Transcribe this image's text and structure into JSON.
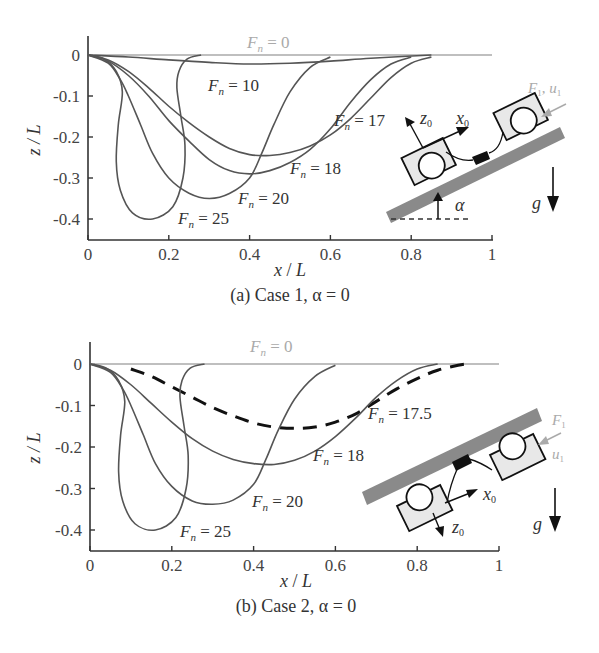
{
  "chart_data": [
    {
      "type": "line",
      "title": "(a) Case 1, α = 0",
      "caption": "(a) Case 1, α = 0",
      "xlabel": "x / L",
      "ylabel": "z / L",
      "xlim": [
        0,
        1
      ],
      "ylim": [
        -0.45,
        0.05
      ],
      "xticks": [
        "0",
        "0.2",
        "0.4",
        "0.6",
        "0.8",
        "1"
      ],
      "yticks": [
        "0",
        "-0.1",
        "-0.2",
        "-0.3",
        "-0.4"
      ],
      "grid": false,
      "series": [
        {
          "name": "Fn = 0",
          "label": "Fn = 0",
          "color": "#aaaaaa",
          "dashed": false,
          "x": [
            0,
            0.2,
            0.4,
            0.6,
            0.8,
            1.0
          ],
          "y": [
            0,
            0,
            0,
            0,
            0,
            0
          ]
        },
        {
          "name": "Fn = 10",
          "label": "Fn = 10",
          "color": "#555555",
          "dashed": false,
          "x": [
            0,
            0.1,
            0.2,
            0.3,
            0.4,
            0.5,
            0.6,
            0.7,
            0.85
          ],
          "y": [
            0,
            -0.005,
            -0.012,
            -0.018,
            -0.022,
            -0.02,
            -0.015,
            -0.008,
            0
          ]
        },
        {
          "name": "Fn = 17",
          "label": "Fn = 17",
          "color": "#555555",
          "dashed": false,
          "x": [
            0,
            0.05,
            0.1,
            0.15,
            0.2,
            0.25,
            0.3,
            0.35,
            0.4,
            0.45,
            0.5,
            0.55,
            0.6,
            0.65,
            0.7,
            0.75,
            0.8,
            0.85
          ],
          "y": [
            0,
            -0.012,
            -0.04,
            -0.08,
            -0.125,
            -0.165,
            -0.2,
            -0.228,
            -0.243,
            -0.245,
            -0.238,
            -0.222,
            -0.195,
            -0.155,
            -0.105,
            -0.055,
            -0.02,
            -0.005
          ]
        },
        {
          "name": "Fn = 18",
          "label": "Fn = 18",
          "color": "#555555",
          "dashed": false,
          "x": [
            0,
            0.05,
            0.1,
            0.15,
            0.2,
            0.25,
            0.3,
            0.35,
            0.4,
            0.45,
            0.5,
            0.55,
            0.6,
            0.65,
            0.7,
            0.75,
            0.8
          ],
          "y": [
            0,
            -0.015,
            -0.05,
            -0.1,
            -0.16,
            -0.21,
            -0.255,
            -0.282,
            -0.29,
            -0.282,
            -0.262,
            -0.23,
            -0.18,
            -0.115,
            -0.06,
            -0.022,
            -0.005
          ]
        },
        {
          "name": "Fn = 20",
          "label": "Fn = 20",
          "color": "#555555",
          "dashed": false,
          "x": [
            0,
            0.05,
            0.08,
            0.1,
            0.13,
            0.16,
            0.2,
            0.25,
            0.3,
            0.35,
            0.4,
            0.43,
            0.46,
            0.5,
            0.55,
            0.6
          ],
          "y": [
            0,
            -0.02,
            -0.06,
            -0.1,
            -0.17,
            -0.24,
            -0.3,
            -0.337,
            -0.35,
            -0.338,
            -0.3,
            -0.24,
            -0.17,
            -0.09,
            -0.03,
            -0.005
          ]
        },
        {
          "name": "Fn = 25",
          "label": "Fn = 25",
          "color": "#555555",
          "dashed": false,
          "x": [
            0,
            0.04,
            0.07,
            0.085,
            0.075,
            0.07,
            0.08,
            0.11,
            0.16,
            0.21,
            0.235,
            0.24,
            0.23,
            0.22,
            0.225,
            0.245,
            0.28
          ],
          "y": [
            0,
            -0.01,
            -0.04,
            -0.09,
            -0.17,
            -0.26,
            -0.33,
            -0.385,
            -0.4,
            -0.37,
            -0.3,
            -0.22,
            -0.15,
            -0.08,
            -0.04,
            -0.01,
            0
          ]
        }
      ],
      "annotations": [
        "Fn = 0",
        "Fn = 10",
        "Fn = 17",
        "Fn = 18",
        "Fn = 20",
        "Fn = 25"
      ],
      "inset": {
        "labels": [
          "z0",
          "x0",
          "F1, u1",
          "α",
          "g"
        ],
        "description": "two-wheeled robot on slope, wheels on top of beam"
      }
    },
    {
      "type": "line",
      "title": "(b) Case 2, α = 0",
      "caption": "(b) Case 2, α = 0",
      "xlabel": "x / L",
      "ylabel": "z / L",
      "xlim": [
        0,
        1
      ],
      "ylim": [
        -0.45,
        0.05
      ],
      "xticks": [
        "0",
        "0.2",
        "0.4",
        "0.6",
        "0.8",
        "1"
      ],
      "yticks": [
        "0",
        "-0.1",
        "-0.2",
        "-0.3",
        "-0.4"
      ],
      "grid": false,
      "series": [
        {
          "name": "Fn = 0",
          "label": "Fn = 0",
          "color": "#aaaaaa",
          "dashed": false,
          "x": [
            0,
            0.2,
            0.4,
            0.6,
            0.8,
            1.0
          ],
          "y": [
            0,
            0,
            0,
            0,
            0,
            0
          ]
        },
        {
          "name": "Fn = 17.5",
          "label": "Fn = 17.5",
          "color": "#111111",
          "dashed": true,
          "x": [
            0.1,
            0.15,
            0.2,
            0.25,
            0.3,
            0.35,
            0.4,
            0.45,
            0.5,
            0.55,
            0.6,
            0.65,
            0.7,
            0.75,
            0.8,
            0.85,
            0.9,
            0.92
          ],
          "y": [
            -0.012,
            -0.03,
            -0.055,
            -0.08,
            -0.105,
            -0.125,
            -0.142,
            -0.152,
            -0.155,
            -0.152,
            -0.14,
            -0.12,
            -0.09,
            -0.06,
            -0.035,
            -0.015,
            -0.003,
            0
          ]
        },
        {
          "name": "Fn = 18",
          "label": "Fn = 18",
          "color": "#555555",
          "dashed": false,
          "x": [
            0,
            0.05,
            0.1,
            0.15,
            0.2,
            0.25,
            0.3,
            0.35,
            0.4,
            0.45,
            0.5,
            0.55,
            0.6,
            0.65,
            0.7,
            0.75,
            0.8,
            0.85
          ],
          "y": [
            0,
            -0.015,
            -0.05,
            -0.095,
            -0.14,
            -0.18,
            -0.21,
            -0.23,
            -0.24,
            -0.242,
            -0.232,
            -0.21,
            -0.175,
            -0.13,
            -0.08,
            -0.04,
            -0.012,
            0
          ]
        },
        {
          "name": "Fn = 20",
          "label": "Fn = 20",
          "color": "#555555",
          "dashed": false,
          "x": [
            0,
            0.05,
            0.08,
            0.1,
            0.13,
            0.16,
            0.2,
            0.25,
            0.3,
            0.35,
            0.4,
            0.43,
            0.46,
            0.5,
            0.55,
            0.6
          ],
          "y": [
            0,
            -0.02,
            -0.06,
            -0.1,
            -0.17,
            -0.24,
            -0.295,
            -0.33,
            -0.338,
            -0.328,
            -0.29,
            -0.23,
            -0.16,
            -0.085,
            -0.03,
            -0.003
          ]
        },
        {
          "name": "Fn = 25",
          "label": "Fn = 25",
          "color": "#555555",
          "dashed": false,
          "x": [
            0,
            0.04,
            0.07,
            0.085,
            0.075,
            0.07,
            0.08,
            0.11,
            0.16,
            0.21,
            0.235,
            0.24,
            0.23,
            0.22,
            0.225,
            0.245,
            0.28
          ],
          "y": [
            0,
            -0.01,
            -0.04,
            -0.09,
            -0.17,
            -0.26,
            -0.33,
            -0.385,
            -0.4,
            -0.37,
            -0.3,
            -0.22,
            -0.15,
            -0.08,
            -0.04,
            -0.01,
            0
          ]
        }
      ],
      "annotations": [
        "Fn = 0",
        "Fn = 17.5",
        "Fn = 18",
        "Fn = 20",
        "Fn = 25"
      ],
      "inset": {
        "labels": [
          "x0",
          "z0",
          "F1",
          "u1",
          "g"
        ],
        "description": "two-wheeled robot hanging under beam"
      }
    }
  ],
  "text": {
    "a": {
      "caption": "(a) Case 1, α = 0",
      "fn0": "0",
      "fn10": "10",
      "fn17": "17",
      "fn18": "18",
      "fn20": "20",
      "fn25": "25"
    },
    "b": {
      "caption": "(b) Case 2, α = 0",
      "fn0": "0",
      "fn175": "17.5",
      "fn18": "18",
      "fn20": "20",
      "fn25": "25"
    },
    "xlabel_x": "x",
    "xlabel_L": "L",
    "ylabel": "z / L"
  }
}
